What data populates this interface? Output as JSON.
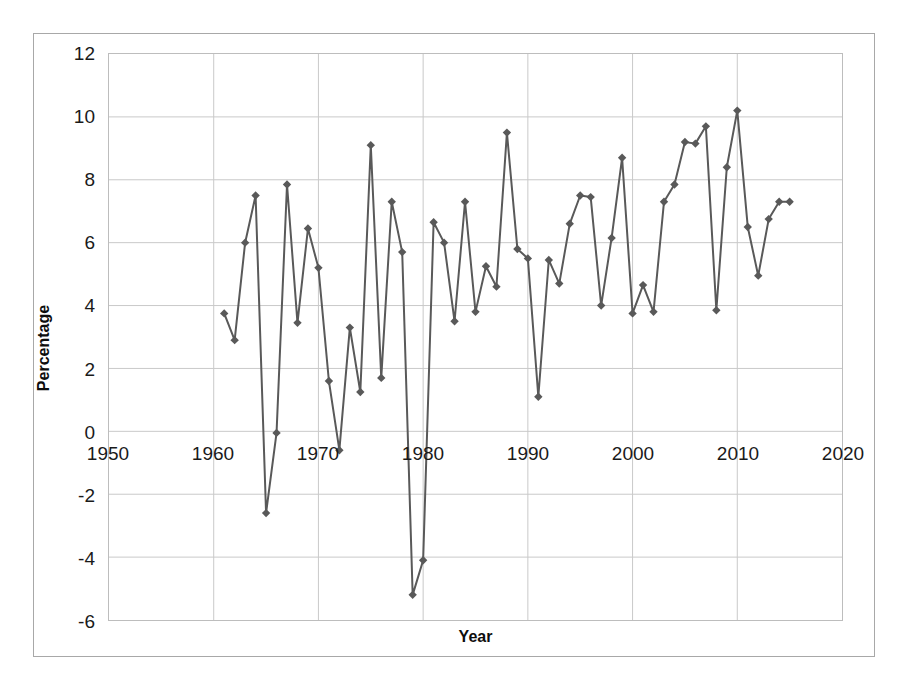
{
  "chart_data": {
    "type": "line",
    "title": "",
    "xlabel": "Year",
    "ylabel": "Percentage",
    "xlim": [
      1950,
      2020
    ],
    "ylim": [
      -6,
      12
    ],
    "xticks": [
      1950,
      1960,
      1970,
      1980,
      1990,
      2000,
      2010,
      2020
    ],
    "yticks": [
      -6,
      -4,
      -2,
      0,
      2,
      4,
      6,
      8,
      10,
      12
    ],
    "grid": true,
    "legend": "none",
    "marker": "diamond",
    "series_color": "#595959",
    "x": [
      1961,
      1962,
      1963,
      1964,
      1965,
      1966,
      1967,
      1968,
      1969,
      1970,
      1971,
      1972,
      1973,
      1974,
      1975,
      1976,
      1977,
      1978,
      1979,
      1980,
      1981,
      1982,
      1983,
      1984,
      1985,
      1986,
      1987,
      1988,
      1989,
      1990,
      1991,
      1992,
      1993,
      1994,
      1995,
      1996,
      1997,
      1998,
      1999,
      2000,
      2001,
      2002,
      2003,
      2004,
      2005,
      2006,
      2007,
      2008,
      2009,
      2010,
      2011,
      2012,
      2013,
      2014,
      2015
    ],
    "values": [
      3.75,
      2.9,
      6.0,
      7.5,
      -2.6,
      -0.05,
      7.85,
      3.45,
      6.45,
      5.2,
      1.6,
      -0.6,
      3.3,
      1.25,
      9.1,
      1.7,
      7.3,
      5.7,
      -5.2,
      -4.1,
      6.65,
      6.0,
      3.5,
      7.3,
      3.8,
      5.25,
      4.6,
      9.5,
      5.8,
      5.5,
      1.1,
      5.45,
      4.7,
      6.6,
      7.5,
      7.45,
      4.0,
      6.15,
      8.7,
      3.75,
      4.65,
      3.8,
      7.3,
      7.85,
      9.2,
      9.15,
      9.7,
      3.85,
      8.4,
      10.2,
      6.5,
      4.95,
      6.75,
      7.3,
      7.3
    ]
  },
  "axis": {
    "x_tick_labels": [
      "1950",
      "1960",
      "1970",
      "1980",
      "1990",
      "2000",
      "2010",
      "2020"
    ],
    "y_tick_labels": [
      "12",
      "10",
      "8",
      "6",
      "4",
      "2",
      "0",
      "-2",
      "-4",
      "-6"
    ],
    "x_title": "Year",
    "y_title": "Percentage"
  }
}
